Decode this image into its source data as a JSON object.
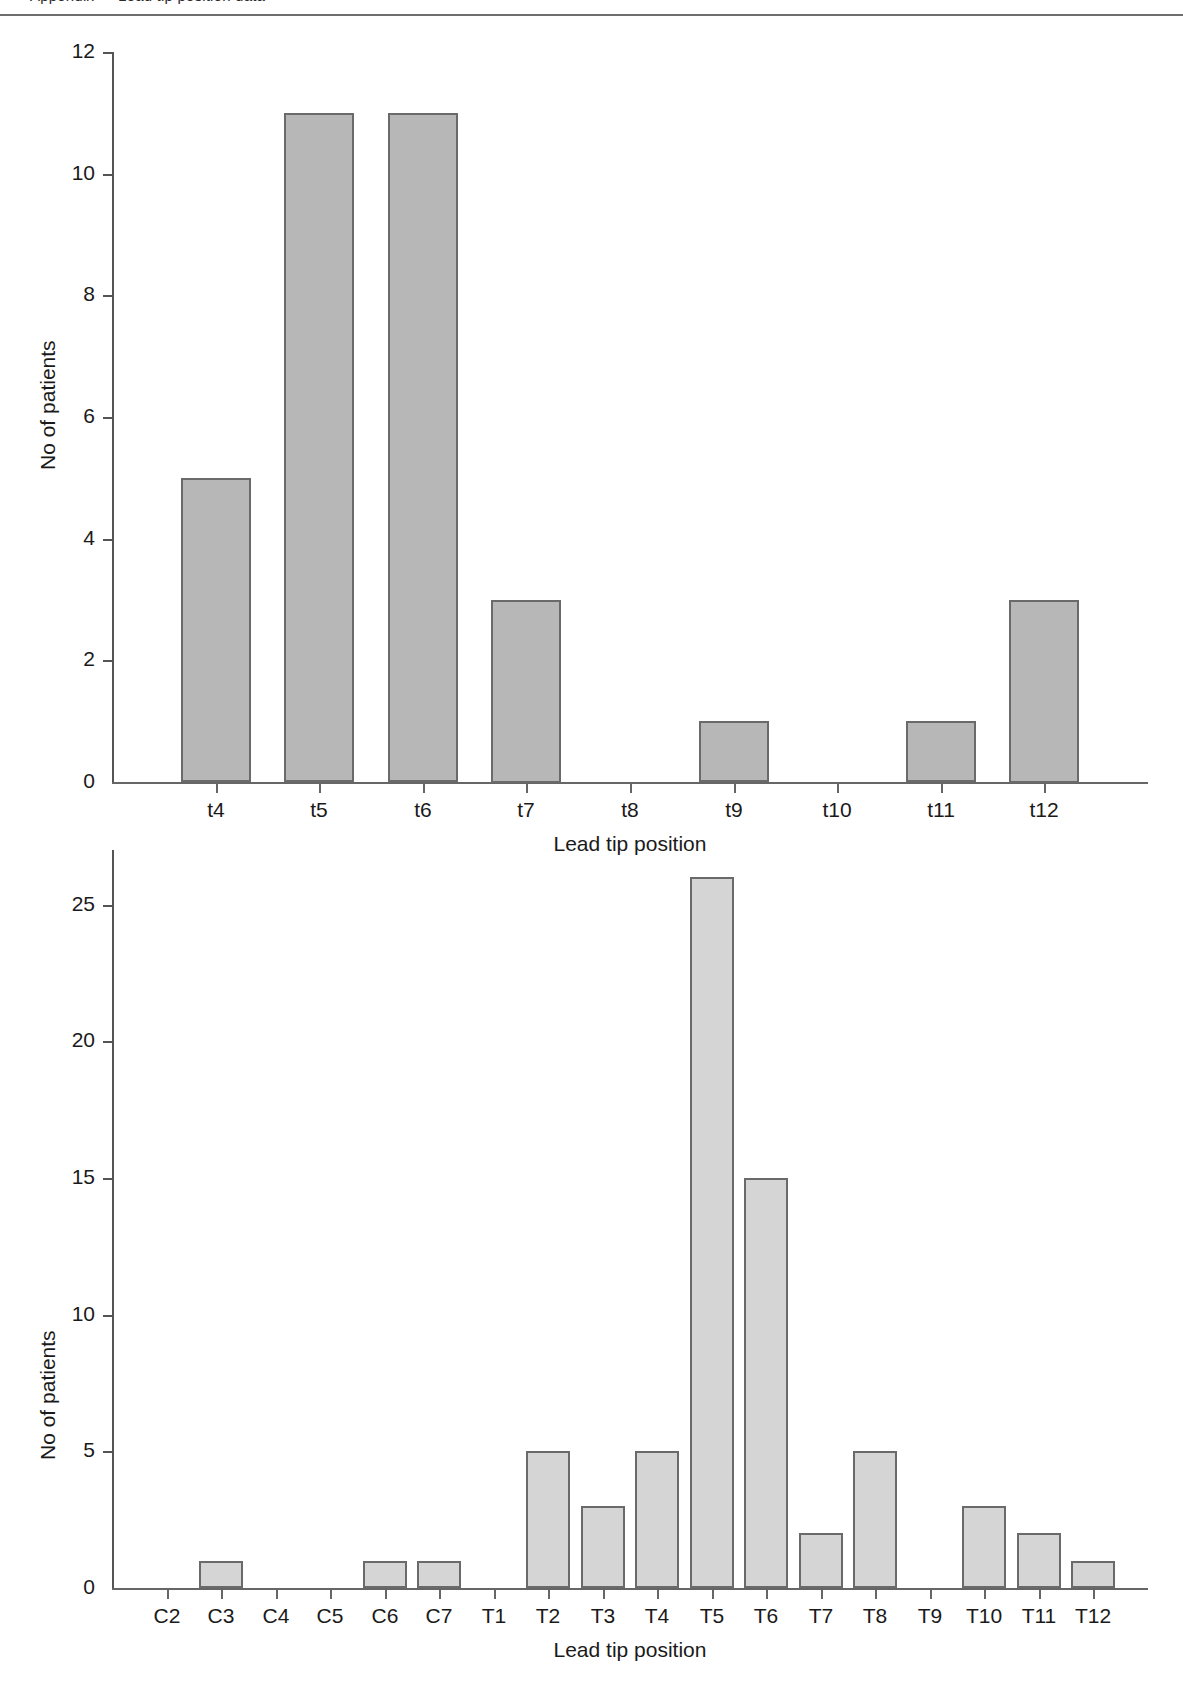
{
  "page": {
    "header_cut_text": "Appendix — Lead tip position data"
  },
  "colors": {
    "bar_fill_top": "#b7b7b7",
    "bar_fill_bottom": "#d5d5d5",
    "bar_stroke": "#6a6a6a",
    "axis": "#595959",
    "text": "#1a1a1a",
    "rule": "#6e6e6e"
  },
  "chart_data": [
    {
      "type": "bar",
      "title": "",
      "xlabel": "Lead tip position",
      "ylabel": "No of patients",
      "categories": [
        "t4",
        "t5",
        "t6",
        "t7",
        "t8",
        "t9",
        "t10",
        "t11",
        "t12"
      ],
      "values": [
        5,
        11,
        11,
        3,
        0,
        1,
        0,
        1,
        3
      ],
      "ylim": [
        0,
        12
      ],
      "yticks": [
        0,
        2,
        4,
        6,
        8,
        10,
        12
      ],
      "ytick_labels": [
        "0",
        "2",
        "4",
        "6",
        "8",
        "10",
        "12"
      ],
      "grid": false,
      "legend": "none"
    },
    {
      "type": "bar",
      "title": "",
      "xlabel": "Lead tip position",
      "ylabel": "No of patients",
      "categories": [
        "C2",
        "C3",
        "C4",
        "C5",
        "C6",
        "C7",
        "T1",
        "T2",
        "T3",
        "T4",
        "T5",
        "T6",
        "T7",
        "T8",
        "T9",
        "T10",
        "T11",
        "T12"
      ],
      "values": [
        0,
        1,
        0,
        0,
        1,
        1,
        0,
        5,
        3,
        5,
        26,
        15,
        2,
        5,
        0,
        3,
        2,
        1
      ],
      "ylim": [
        0,
        27
      ],
      "yticks": [
        0,
        5,
        10,
        15,
        20,
        25
      ],
      "ytick_labels": [
        "0",
        "5",
        "10",
        "15",
        "20",
        "25"
      ],
      "grid": false,
      "legend": "none"
    }
  ]
}
